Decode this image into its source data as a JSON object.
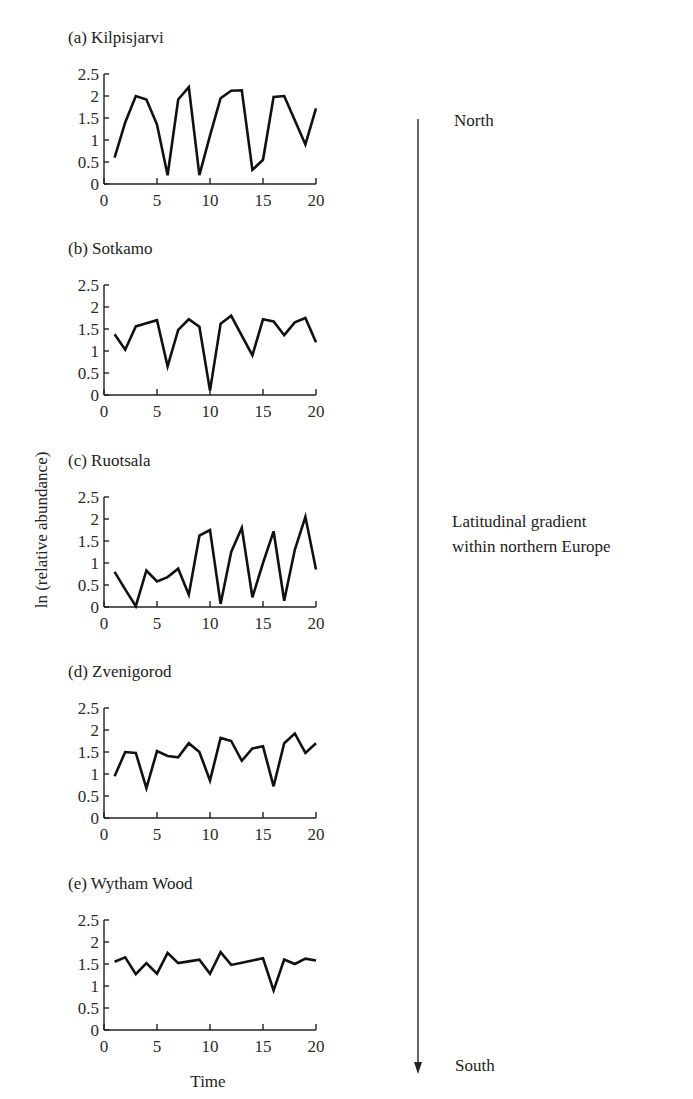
{
  "chart_data": [
    {
      "type": "line",
      "title": "(a) Kilpisjarvi",
      "xlabel": "",
      "ylabel": "ln (relative abundance)",
      "x": [
        1,
        2,
        3,
        4,
        5,
        6,
        7,
        8,
        9,
        10,
        11,
        12,
        13,
        14,
        15,
        16,
        17,
        18,
        19,
        20
      ],
      "values": [
        0.6,
        1.4,
        2.0,
        1.92,
        1.35,
        0.2,
        1.92,
        2.2,
        0.2,
        1.1,
        1.95,
        2.12,
        2.13,
        0.32,
        0.55,
        1.98,
        2.0,
        1.45,
        0.9,
        1.72
      ],
      "xlim": [
        0,
        20
      ],
      "ylim": [
        0,
        2.5
      ],
      "xticks": [
        "0",
        "5",
        "10",
        "15",
        "20"
      ],
      "yticks": [
        "0",
        "0.5",
        "1",
        "1.5",
        "2",
        "2.5"
      ],
      "grid": false
    },
    {
      "type": "line",
      "title": "(b) Sotkamo",
      "xlabel": "",
      "ylabel": "ln (relative abundance)",
      "x": [
        1,
        2,
        3,
        4,
        5,
        6,
        7,
        8,
        9,
        10,
        11,
        12,
        13,
        14,
        15,
        16,
        17,
        18,
        19,
        20
      ],
      "values": [
        1.38,
        1.03,
        1.56,
        1.63,
        1.7,
        0.65,
        1.48,
        1.72,
        1.55,
        0.1,
        1.62,
        1.8,
        1.35,
        0.9,
        1.72,
        1.67,
        1.36,
        1.65,
        1.75,
        1.2
      ],
      "xlim": [
        0,
        20
      ],
      "ylim": [
        0,
        2.5
      ],
      "xticks": [
        "0",
        "5",
        "10",
        "15",
        "20"
      ],
      "yticks": [
        "0",
        "0.5",
        "1",
        "1.5",
        "2",
        "2.5"
      ],
      "grid": false
    },
    {
      "type": "line",
      "title": "(c) Ruotsala",
      "xlabel": "",
      "ylabel": "ln (relative abundance)",
      "x": [
        1,
        2,
        3,
        4,
        5,
        6,
        7,
        8,
        9,
        10,
        11,
        12,
        13,
        14,
        15,
        16,
        17,
        18,
        19,
        20
      ],
      "values": [
        0.8,
        0.4,
        0.02,
        0.83,
        0.58,
        0.68,
        0.87,
        0.28,
        1.62,
        1.75,
        0.07,
        1.25,
        1.8,
        0.22,
        1.0,
        1.72,
        0.14,
        1.3,
        2.05,
        0.85
      ],
      "xlim": [
        0,
        20
      ],
      "ylim": [
        0,
        2.5
      ],
      "xticks": [
        "0",
        "5",
        "10",
        "15",
        "20"
      ],
      "yticks": [
        "0",
        "0.5",
        "1",
        "1.5",
        "2",
        "2.5"
      ],
      "grid": false
    },
    {
      "type": "line",
      "title": "(d) Zvenigorod",
      "xlabel": "",
      "ylabel": "ln (relative abundance)",
      "x": [
        1,
        2,
        3,
        4,
        5,
        6,
        7,
        8,
        9,
        10,
        11,
        12,
        13,
        14,
        15,
        16,
        17,
        18,
        19,
        20
      ],
      "values": [
        0.95,
        1.5,
        1.48,
        0.68,
        1.52,
        1.41,
        1.38,
        1.7,
        1.5,
        0.85,
        1.82,
        1.75,
        1.3,
        1.58,
        1.63,
        0.72,
        1.7,
        1.92,
        1.48,
        1.7
      ],
      "xlim": [
        0,
        20
      ],
      "ylim": [
        0,
        2.5
      ],
      "xticks": [
        "0",
        "5",
        "10",
        "15",
        "20"
      ],
      "yticks": [
        "0",
        "0.5",
        "1",
        "1.5",
        "2",
        "2.5"
      ],
      "grid": false
    },
    {
      "type": "line",
      "title": "(e) Wytham Wood",
      "xlabel": "Time",
      "ylabel": "ln (relative abundance)",
      "x": [
        1,
        2,
        3,
        4,
        5,
        6,
        7,
        8,
        9,
        10,
        11,
        12,
        13,
        14,
        15,
        16,
        17,
        18,
        19,
        20
      ],
      "values": [
        1.55,
        1.65,
        1.27,
        1.52,
        1.28,
        1.75,
        1.52,
        1.56,
        1.6,
        1.28,
        1.77,
        1.48,
        1.53,
        1.58,
        1.63,
        0.9,
        1.6,
        1.5,
        1.62,
        1.58
      ],
      "xlim": [
        0,
        20
      ],
      "ylim": [
        0,
        2.5
      ],
      "xticks": [
        "0",
        "5",
        "10",
        "15",
        "20"
      ],
      "yticks": [
        "0",
        "0.5",
        "1",
        "1.5",
        "2",
        "2.5"
      ],
      "grid": false
    }
  ],
  "figure": {
    "ylabel": "ln (relative abundance)",
    "xlabel": "Time",
    "gradient": {
      "top_label": "North",
      "bottom_label": "South",
      "caption_line1": "Latitudinal gradient",
      "caption_line2": "within northern Europe"
    }
  }
}
